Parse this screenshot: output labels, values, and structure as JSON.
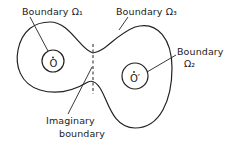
{
  "diagram": {
    "labels": {
      "boundary_1": "Boundary Ω₁",
      "boundary_3": "Boundary Ω₃",
      "boundary_2_line1": "Boundary",
      "boundary_2_line2": "Ω₂",
      "imaginary_line1": "Imaginary",
      "imaginary_line2": "boundary"
    },
    "points": {
      "left_center": "O",
      "right_center": "O′"
    },
    "colors": {
      "ink": "#222222",
      "background": "#ffffff"
    }
  }
}
